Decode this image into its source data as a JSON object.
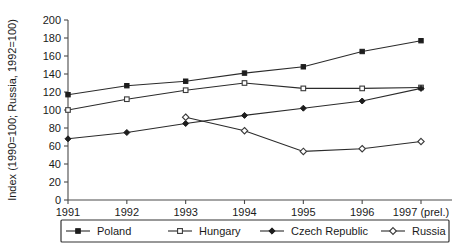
{
  "chart_data": {
    "type": "line",
    "title": "",
    "xlabel": "",
    "ylabel": "Index (1990=100; Russia, 1992=100)",
    "x": [
      "1991",
      "1992",
      "1993",
      "1994",
      "1995",
      "1996",
      "1997 (prel.)"
    ],
    "categories": [
      "1991",
      "1992",
      "1993",
      "1994",
      "1995",
      "1996",
      "1997 (prel.)"
    ],
    "ylim": [
      0,
      200
    ],
    "yticks": [
      0,
      20,
      40,
      60,
      80,
      100,
      120,
      140,
      160,
      180,
      200
    ],
    "grid": false,
    "legend_position": "bottom",
    "series": [
      {
        "name": "Poland",
        "marker": "filled-square",
        "values": [
          117,
          127,
          132,
          141,
          148,
          165,
          177
        ]
      },
      {
        "name": "Hungary",
        "marker": "open-square",
        "values": [
          100,
          112,
          122,
          130,
          124,
          124,
          125
        ]
      },
      {
        "name": "Czech Republic",
        "marker": "filled-diamond",
        "values": [
          68,
          75,
          85,
          94,
          102,
          110,
          124
        ]
      },
      {
        "name": "Russia",
        "marker": "open-diamond",
        "values": [
          null,
          null,
          92,
          77,
          54,
          57,
          65
        ]
      }
    ]
  },
  "axis": {
    "y_title": "Index (1990=100; Russia, 1992=100)",
    "y_labels": [
      "200",
      "180",
      "160",
      "140",
      "120",
      "100",
      "80",
      "60",
      "40",
      "20",
      "0"
    ],
    "x_labels": [
      "1991",
      "1992",
      "1993",
      "1994",
      "1995",
      "1996",
      "1997 (prel.)"
    ]
  },
  "legend": {
    "items": [
      {
        "label": "Poland",
        "marker": "filled-square"
      },
      {
        "label": "Hungary",
        "marker": "open-square"
      },
      {
        "label": "Czech Republic",
        "marker": "filled-diamond"
      },
      {
        "label": "Russia",
        "marker": "open-diamond"
      }
    ]
  },
  "colors": {
    "axis": "#4a4a4a",
    "line": "#2b2b2b",
    "marker_fill": "#1d1d1d",
    "marker_open": "#ffffff",
    "background": "#ffffff"
  }
}
